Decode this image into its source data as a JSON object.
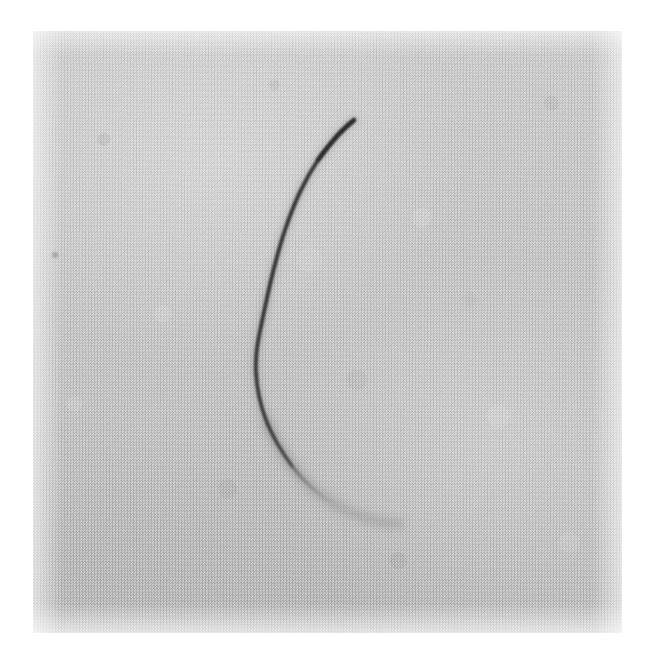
{
  "image": {
    "title": "Curved filament on textured ground",
    "medium": "halftone-printed monochrome photograph",
    "subject_description": "A single thin dark curved fibre or hair, bowed to the left, lying on a coarse woven grey cloth background",
    "page_background_color": "#ffffff",
    "plate": {
      "left": 33,
      "top": 31,
      "width": 589,
      "height": 602,
      "background_color": "#c9c9c9",
      "texture": "halftone dot screen over woven cloth weave",
      "highlight_tone": "#dcdcdc",
      "shadow_tone": "#bdbdbd"
    },
    "filament": {
      "stroke_color": "#3a3a3a",
      "faded_tail_color": "#8f8f8f",
      "description": "C-shaped arc opening to the right",
      "tip_top": [
        354,
        120
      ],
      "leftmost": [
        256,
        348
      ],
      "tail_end": [
        401,
        524
      ],
      "path_points": [
        [
          354,
          120
        ],
        [
          338,
          135
        ],
        [
          318,
          160
        ],
        [
          300,
          192
        ],
        [
          285,
          230
        ],
        [
          273,
          272
        ],
        [
          264,
          312
        ],
        [
          257,
          348
        ],
        [
          256,
          372
        ],
        [
          259,
          396
        ],
        [
          266,
          420
        ],
        [
          277,
          443
        ],
        [
          292,
          466
        ],
        [
          311,
          487
        ],
        [
          334,
          504
        ],
        [
          360,
          516
        ],
        [
          383,
          522
        ],
        [
          401,
          524
        ]
      ]
    },
    "artifacts": [
      {
        "name": "dark-speck",
        "x": 55,
        "y": 255,
        "size": 3
      },
      {
        "name": "faint-smudge",
        "x": 470,
        "y": 300,
        "size": 6
      }
    ],
    "margins": {
      "top": "white paper margin",
      "bottom": "white paper margin",
      "left": "white paper margin",
      "right": "white paper margin"
    }
  }
}
